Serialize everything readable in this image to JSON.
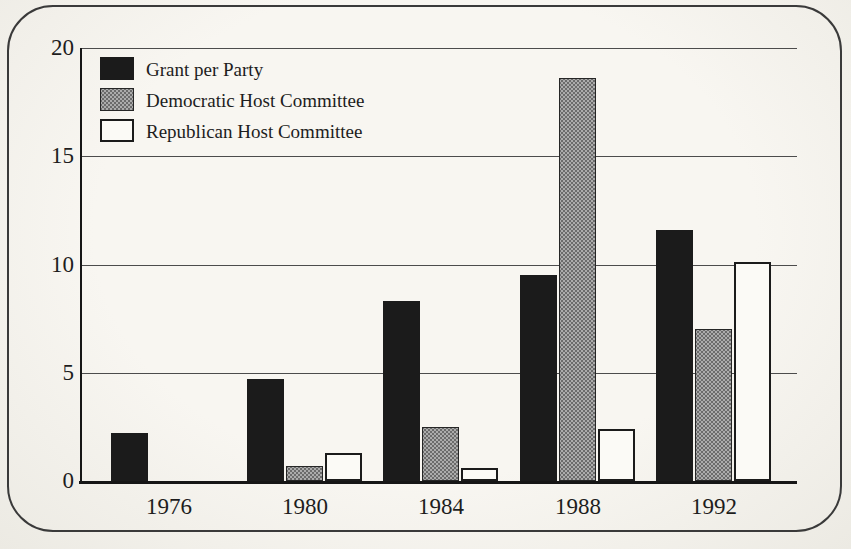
{
  "figure": {
    "paper_color": "#f6f4ef",
    "border_color": "#3a3a3a",
    "axis_color": "#161616",
    "gridline_color": "#4c4c4c"
  },
  "chart_data": {
    "type": "bar",
    "title": "",
    "xlabel": "",
    "ylabel": "",
    "categories": [
      "1976",
      "1980",
      "1984",
      "1988",
      "1992"
    ],
    "series": [
      {
        "name": "Grant per Party",
        "style": "solid-black",
        "color": "#1b1b1b",
        "values": [
          2.2,
          4.7,
          8.3,
          9.5,
          11.6
        ]
      },
      {
        "name": "Democratic Host Committee",
        "style": "halftone-gray",
        "color": "#9a9a9a",
        "values": [
          0,
          0.7,
          2.5,
          18.6,
          7.0
        ]
      },
      {
        "name": "Republican Host Committee",
        "style": "outline-white",
        "color": "#fbfaf6",
        "values": [
          0,
          1.3,
          0.6,
          2.4,
          10.1
        ]
      }
    ],
    "ylim": [
      0,
      20
    ],
    "yticks": [
      0,
      5,
      10,
      15,
      20
    ],
    "grid": "horizontal",
    "legend_position": "top-left-inside"
  }
}
